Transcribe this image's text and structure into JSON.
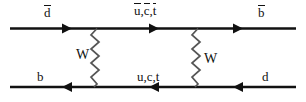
{
  "diagram": {
    "kind": "feynman-box-diagram",
    "colors": {
      "line": "#111111",
      "background": "#ffffff"
    },
    "top_line": {
      "antiparticle_in_label": "d",
      "antiparticle_in_overbar": true,
      "internal_label": "u,c,t",
      "internal_overbar": true,
      "antiparticle_out_label": "b",
      "antiparticle_out_overbar": true,
      "arrow_direction": "left"
    },
    "bottom_line": {
      "particle_in_label": "b",
      "internal_label": "u,c,t",
      "particle_out_label": "d",
      "arrow_direction": "right"
    },
    "propagators": [
      {
        "label": "W",
        "side": "left",
        "style": "zigzag"
      },
      {
        "label": "W",
        "side": "right",
        "style": "zigzag"
      }
    ]
  },
  "labels": {
    "top_left": "d",
    "top_mid_u": "u",
    "top_mid_c": "c",
    "top_mid_t": "t",
    "top_mid_sep1": ",",
    "top_mid_sep2": ",",
    "top_right": "b",
    "bottom_left": "b",
    "bottom_mid": "u,c,t",
    "bottom_right": "d",
    "w_left": "W",
    "w_right": "W"
  }
}
